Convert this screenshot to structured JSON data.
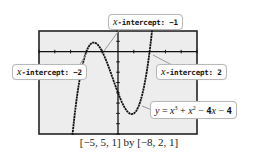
{
  "chart_data": {
    "type": "line",
    "title": "",
    "function": "y = x^3 + x^2 - 4x - 4",
    "xlabel": "",
    "ylabel": "",
    "xlim": [
      -5,
      5
    ],
    "ylim": [
      -8,
      2
    ],
    "xscl": 1,
    "yscl": 1,
    "grid": false,
    "window_caption": "[−5, 5, 1] by [−8, 2, 1]",
    "x_intercepts": [
      -2,
      -1,
      2
    ],
    "annotations": [
      {
        "label_var": "x",
        "label_text": "-intercept: ",
        "value": "−1",
        "x": -1,
        "y": 0
      },
      {
        "label_var": "x",
        "label_text": "-intercept: ",
        "value": "−2",
        "x": -2,
        "y": 0
      },
      {
        "label_var": "x",
        "label_text": "-intercept: ",
        "value": "2",
        "x": 2,
        "y": 0
      },
      {
        "label": "y = x³ + x² − 4x − 4"
      }
    ],
    "series": [
      {
        "name": "y = x^3 + x^2 - 4x - 4",
        "x": [
          -3.2,
          -3,
          -2.5,
          -2,
          -1.5,
          -1.13,
          -1,
          -0.5,
          0,
          0.5,
          1,
          1.18,
          1.5,
          2,
          2.2,
          2.35
        ],
        "y": [
          -8.7,
          -10,
          -3.4,
          0,
          0.9,
          1.13,
          0,
          -2.4,
          -4,
          -5.6,
          -6,
          -6.06,
          -5.6,
          0,
          3.3,
          5.9
        ]
      }
    ]
  },
  "callouts": {
    "top": {
      "var": "x",
      "text": "-intercept: ",
      "value": "−1"
    },
    "left": {
      "var": "x",
      "text": "-intercept: ",
      "value": "−2"
    },
    "right": {
      "var": "x",
      "text": "-intercept: ",
      "value": "2"
    },
    "equation": {
      "y": "y",
      "eq": " = ",
      "x1": "x",
      "p1": "3",
      "plus": " + ",
      "x2": "x",
      "p2": "2",
      "rest1": " − ",
      "four": "4",
      "x3": "x",
      "rest2": " − ",
      "four2": "4"
    }
  },
  "caption": "[−5, 5, 1] by [−8, 2, 1]",
  "colors": {
    "screen_bg": "#ededed",
    "frame": "#222222",
    "curve": "#111111",
    "leader": "#9a9a9a"
  }
}
